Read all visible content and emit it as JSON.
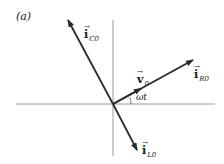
{
  "panel_label": "(a)",
  "axes": {
    "origin": [
      113,
      104
    ],
    "horizontal": {
      "x1": 16,
      "x2": 215,
      "y": 104
    },
    "vertical": {
      "x": 113,
      "y1": 20,
      "y2": 156
    },
    "color": "#9a9a9a"
  },
  "vectors": [
    {
      "id": "iC0",
      "symbol": "i",
      "subscript": "C0",
      "tip": [
        68,
        20
      ],
      "color": "#2b2b2b"
    },
    {
      "id": "iR0",
      "symbol": "i",
      "subscript": "R0",
      "tip": [
        193,
        60
      ],
      "color": "#2b2b2b"
    },
    {
      "id": "iL0",
      "symbol": "i",
      "subscript": "L0",
      "tip": [
        137,
        150
      ],
      "color": "#2b2b2b"
    },
    {
      "id": "v0",
      "symbol": "v",
      "subscript": "0",
      "tip": [
        141,
        89
      ],
      "color": "#2b2b2b"
    }
  ],
  "angle_label": "ωt",
  "labels": {
    "iC0": {
      "text": "i",
      "sub": "C0"
    },
    "iR0": {
      "text": "i",
      "sub": "R0"
    },
    "iL0": {
      "text": "i",
      "sub": "L0"
    },
    "v0": {
      "text": "v",
      "sub": "0"
    },
    "vector_arrow": "→"
  }
}
